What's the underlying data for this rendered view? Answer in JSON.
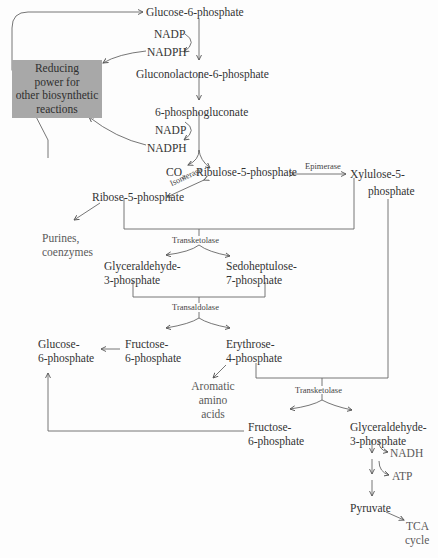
{
  "diagram": {
    "type": "metabolic-pathway",
    "colors": {
      "line": "#555555",
      "text": "#333333",
      "box_fill": "#a8a8a8",
      "background": "#fdfdfd"
    },
    "nodes": {
      "g6p_top": "Glucose-6-phosphate",
      "nadp1": "NADP",
      "nadph1": "NADPH",
      "reducing_power": "Reducing power for other biosynthetic reactions",
      "reducing_power_lines": [
        "Reducing",
        "power for",
        "other biosynthetic",
        "reactions"
      ],
      "gluconolactone": "Gluconolactone-6-phosphate",
      "phosphogluconate": "6-phosphogluconate",
      "nadp2": "NADP",
      "nadph2": "NADPH",
      "co2": "CO",
      "co2_sub": "2",
      "ribulose5p": "Ribulose-5-phosphate",
      "xylulose5p_1": "Xylulose-5-",
      "xylulose5p_2": "phosphate",
      "ribose5p": "Ribose-5-phosphate",
      "purines_1": "Purines,",
      "purines_2": "coenzymes",
      "gap1_1": "Glyceraldehyde-",
      "gap1_2": "3-phosphate",
      "s7p_1": "Sedoheptulose-",
      "s7p_2": "7-phosphate",
      "g6p_left_1": "Glucose-",
      "g6p_left_2": "6-phosphate",
      "f6p1_1": "Fructose-",
      "f6p1_2": "6-phosphate",
      "e4p_1": "Erythrose-",
      "e4p_2": "4-phosphate",
      "aromatic_1": "Aromatic",
      "aromatic_2": "amino",
      "aromatic_3": "acids",
      "f6p2_1": "Fructose-",
      "f6p2_2": "6-phosphate",
      "gap2_1": "Glyceraldehyde-",
      "gap2_2": "3-phosphate",
      "nadh": "NADH",
      "atp": "ATP",
      "pyruvate": "Pyruvate",
      "tca_1": "TCA",
      "tca_2": "cycle"
    },
    "enzymes": {
      "isomerase": "Isomerase",
      "epimerase": "Epimerase",
      "transketolase1": "Transketolase",
      "transaldolase": "Transaldolase",
      "transketolase2": "Transketolase"
    }
  }
}
